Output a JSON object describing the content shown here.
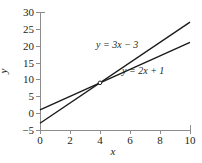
{
  "chart_data": {
    "type": "line",
    "title": "",
    "xlabel": "x",
    "ylabel": "y",
    "xlim": [
      0,
      10
    ],
    "ylim": [
      -5,
      30
    ],
    "xticks": [
      0,
      2,
      4,
      6,
      8,
      10
    ],
    "xticklabels": [
      "0",
      "2",
      "4",
      "6",
      "8",
      "10"
    ],
    "yticks": [
      -5,
      0,
      5,
      10,
      15,
      20,
      25,
      30
    ],
    "yticklabels": [
      "−5",
      "0",
      "5",
      "10",
      "15",
      "20",
      "25",
      "30"
    ],
    "grid": false,
    "legend_position": "inline-annotations",
    "line_color": "#1a1a1a",
    "axis_color": "#8d8d8d",
    "background": "#ffffff",
    "series": [
      {
        "name": "y = 3x − 3",
        "annotation": "y = 3x − 3",
        "slope": 3,
        "intercept": -3,
        "x": [
          0,
          10
        ],
        "values": [
          -3,
          27
        ]
      },
      {
        "name": "y = 2x + 1",
        "annotation": "y = 2x + 1",
        "slope": 2,
        "intercept": 1,
        "x": [
          0,
          10
        ],
        "values": [
          1,
          21
        ]
      }
    ],
    "intersection": {
      "x": 4,
      "y": 9,
      "marked": true
    }
  }
}
